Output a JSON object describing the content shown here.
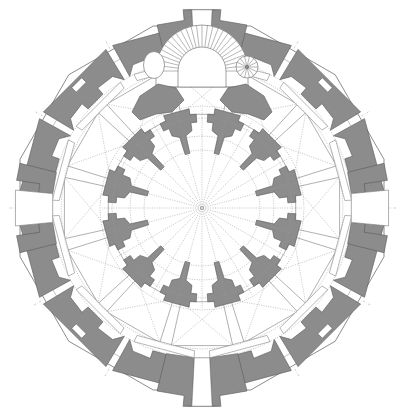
{
  "document": {
    "title": "Centrally Planned Dodecagonal Church — Ground Floor Plan",
    "drawing_type": "architectural floor plan",
    "projection": "orthographic plan, north at top"
  },
  "canvas": {
    "width": 400,
    "height": 414,
    "background": "#ffffff",
    "center_x": 202,
    "center_y": 208
  },
  "palette": {
    "wall_fill": "#8c8c8c",
    "wall_stroke": "#5e5e5e",
    "outline_stroke": "#6e6e6e",
    "hairline_stroke": "#909090",
    "vault_dash": "#9a9a9a",
    "open_fill": "#ffffff",
    "stair_stroke": "#7a7a7a",
    "page_background": "#ffffff"
  },
  "geometry": {
    "plan_type": "radial centralized",
    "sides": 12,
    "bays": 12,
    "symmetry": "bilateral about the vertical axis",
    "rotation_offset_deg": 15,
    "radii": {
      "outer_envelope": 182,
      "outer_wall_inner_face": 170,
      "ambulatory_outer": 150,
      "chapel_outer": 141,
      "chapel_inner": 96,
      "pier_ring_outer": 100,
      "pier_ring_inner": 62,
      "dome_drum": 58,
      "crossing_core": 20
    },
    "piers": {
      "count": 12,
      "shape": "stepped cruciform with inward tail",
      "angles_deg": [
        15,
        45,
        75,
        105,
        135,
        165,
        195,
        225,
        255,
        285,
        315,
        345
      ]
    },
    "chapel_bays": {
      "count": 12,
      "shape": "trapezoidal, vaulted",
      "vault": "cross-rib, dotted"
    },
    "perimeter_wall_segments": {
      "count": 12,
      "alternating": "solid mass / recessed niche"
    },
    "axes": [
      {
        "name": "vertical-axis",
        "angle_deg": 90
      },
      {
        "name": "horizontal-axis",
        "angle_deg": 0
      },
      {
        "name": "diagonal-axis-a",
        "angle_deg": 30
      },
      {
        "name": "diagonal-axis-b",
        "angle_deg": 60
      },
      {
        "name": "diagonal-axis-c",
        "angle_deg": 120
      },
      {
        "name": "diagonal-axis-d",
        "angle_deg": 150
      }
    ]
  },
  "features": {
    "main_entrance_north": {
      "name": "north projecting portal",
      "position": "top center",
      "opening_width": 44,
      "state": "open threshold"
    },
    "main_entrance_south": {
      "name": "south projecting portal",
      "position": "bottom center",
      "opening_width": 44,
      "state": "open threshold"
    },
    "side_door_west": {
      "name": "west side door",
      "position": "left mid-axis",
      "state": "open threshold"
    },
    "side_door_east": {
      "name": "east side door",
      "position": "right mid-axis",
      "state": "open threshold"
    },
    "grand_stair": {
      "name": "semicircular grand staircase",
      "position": "north vestibule",
      "tread_count": 26,
      "form": "horseshoe / semicircular with radial treads",
      "inner_radius": 24,
      "outer_radius": 46
    },
    "spiral_stair": {
      "name": "spiral staircase",
      "position": "north-east of vestibule",
      "tread_count": 14,
      "radius": 11
    },
    "oval_chamber": {
      "name": "oval chamber",
      "position": "north-west of vestibule",
      "form": "ellipse",
      "width": 21,
      "height": 27
    },
    "niche_windows": {
      "count": 4,
      "description": "rectangular wall recesses on the diagonal perimeter walls"
    }
  },
  "annotations": {
    "scale_bar": null,
    "north_arrow": null,
    "labels": []
  }
}
